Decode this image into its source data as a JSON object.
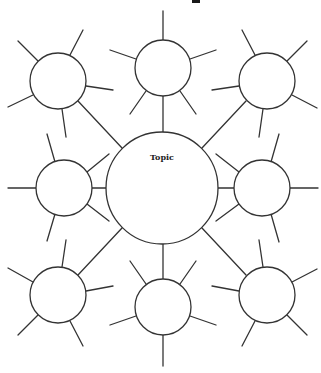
{
  "diagram": {
    "type": "bubble-map",
    "center": {
      "label": "Topic",
      "cx": 162,
      "cy": 188,
      "r": 56
    },
    "bubbles": [
      {
        "id": "top",
        "cx": 163,
        "cy": 68,
        "r": 28,
        "label": ""
      },
      {
        "id": "top-left",
        "cx": 58,
        "cy": 81,
        "r": 28,
        "label": ""
      },
      {
        "id": "top-right",
        "cx": 267,
        "cy": 81,
        "r": 28,
        "label": ""
      },
      {
        "id": "middle-left",
        "cx": 64,
        "cy": 188,
        "r": 28,
        "label": ""
      },
      {
        "id": "middle-right",
        "cx": 262,
        "cy": 188,
        "r": 28,
        "label": ""
      },
      {
        "id": "bottom-left",
        "cx": 58,
        "cy": 295,
        "r": 28,
        "label": ""
      },
      {
        "id": "bottom",
        "cx": 163,
        "cy": 307,
        "r": 28,
        "label": ""
      },
      {
        "id": "bottom-right",
        "cx": 267,
        "cy": 295,
        "r": 28,
        "label": ""
      }
    ],
    "colors": {
      "stroke": "#333333",
      "fill": "#ffffff",
      "background": "#ffffff"
    }
  }
}
